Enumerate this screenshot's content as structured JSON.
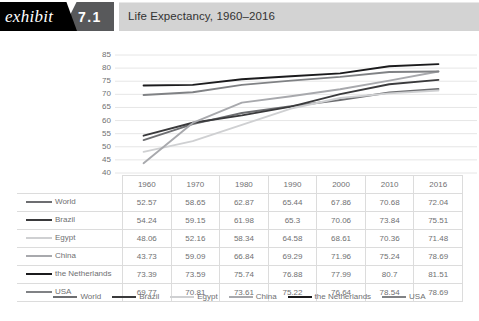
{
  "header": {
    "exhibit_label": "exhibit",
    "exhibit_number": "7.1",
    "title": "Life Expectancy, 1960–2016"
  },
  "chart_data": {
    "type": "line",
    "title": "Life Expectancy, 1960–2016",
    "xlabel": "",
    "ylabel": "",
    "categories": [
      "1960",
      "1970",
      "1980",
      "1990",
      "2000",
      "2010",
      "2016"
    ],
    "ylim": [
      40,
      85
    ],
    "yticks": [
      "85",
      "80",
      "75",
      "70",
      "65",
      "60",
      "55",
      "50",
      "45",
      "40"
    ],
    "grid": true,
    "legend_position": "bottom",
    "series": [
      {
        "name": "World",
        "color": "#6d6e71",
        "values": [
          "52.57",
          "58.65",
          "62.87",
          "65.44",
          "67.86",
          "70.68",
          "72.04"
        ]
      },
      {
        "name": "Brazil",
        "color": "#3a3a3c",
        "values": [
          "54.24",
          "59.15",
          "61.98",
          "65.3",
          "70.06",
          "73.84",
          "75.51"
        ]
      },
      {
        "name": "Egypt",
        "color": "#cfd0d2",
        "values": [
          "48.06",
          "52.16",
          "58.34",
          "64.58",
          "68.61",
          "70.36",
          "71.48"
        ]
      },
      {
        "name": "China",
        "color": "#a8a9ad",
        "values": [
          "43.73",
          "59.09",
          "66.84",
          "69.29",
          "71.96",
          "75.24",
          "78.69"
        ]
      },
      {
        "name": "the Netherlands",
        "color": "#1b1b1d",
        "values": [
          "73.39",
          "73.59",
          "75.74",
          "76.88",
          "77.99",
          "80.7",
          "81.51"
        ]
      },
      {
        "name": "USA",
        "color": "#808285",
        "values": [
          "69.77",
          "70.81",
          "73.61",
          "75.22",
          "76.64",
          "78.54",
          "78.69"
        ]
      }
    ]
  }
}
